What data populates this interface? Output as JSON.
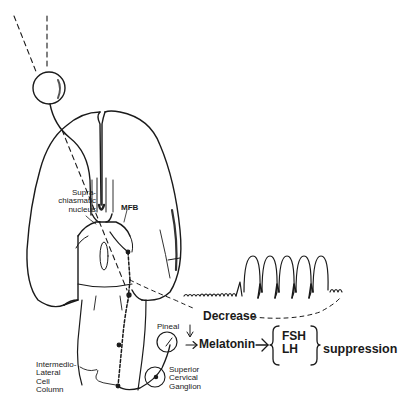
{
  "diagram": {
    "type": "neuroanatomy-pathway",
    "labels": {
      "scn": [
        "Supra-",
        "chiasmatic",
        "nucleus"
      ],
      "mfb": "MFB",
      "pineal": "Pineal",
      "scg": [
        "Superior",
        "Cervical",
        "Ganglion"
      ],
      "iml": [
        "Intermedio-",
        "Lateral",
        "Cell",
        "Column"
      ],
      "decrease": "Decrease",
      "melatonin": "Melatonin",
      "hormones": [
        "FSH",
        "LH"
      ],
      "suppression": "suppression"
    },
    "elements": {
      "eye": "circle at top-left with light rays (dashed lines)",
      "brain": "ventral view of brain hemispheres",
      "gonad_activity_trace": "oscillating waveform increasing in amplitude to the right",
      "arrows": [
        "Decrease -> Melatonin",
        "Pineal -> Melatonin",
        "Melatonin -> {FSH, LH}"
      ]
    },
    "colors": {
      "ink": "#1a1a1a",
      "background": "#ffffff"
    }
  }
}
